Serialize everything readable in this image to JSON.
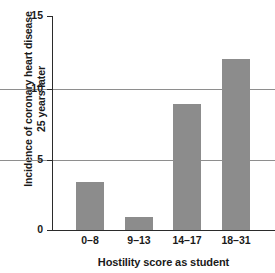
{
  "chart_data": {
    "type": "bar",
    "title": "",
    "subtitle": "",
    "categories": [
      "0–8",
      "9–13",
      "14–17",
      "18–31"
    ],
    "values": [
      3.4,
      0.9,
      8.8,
      12.0
    ],
    "series": [
      {
        "name": "Incidence of coronary heart disease 25 years later",
        "values": [
          3.4,
          0.9,
          8.8,
          12.0
        ]
      }
    ],
    "xlabel": "Hostility score as student",
    "ylabel": "Incidence of coronary heart disease 25 years later",
    "ylabel_lines": [
      "Incidence of coronary heart disease",
      "25 years later"
    ],
    "ylim": [
      0,
      15
    ],
    "xlim_note": "categorical",
    "yticks": [
      0,
      5,
      10,
      15
    ],
    "ytick_labels": [
      "0",
      "5",
      "10",
      "15"
    ],
    "gridlines": {
      "horizontal": true,
      "vertical": false,
      "at": [
        5,
        10
      ],
      "color": "#8e8e8e"
    },
    "legend": {
      "visible": false,
      "position": "none",
      "entries": []
    },
    "annotations": [],
    "colors": {
      "bar_fill": "#8c8c8c",
      "axis": "#2b2b2b",
      "grid": "#8e8e8e",
      "text": "#1a1a1a",
      "background": "#ffffff"
    }
  }
}
